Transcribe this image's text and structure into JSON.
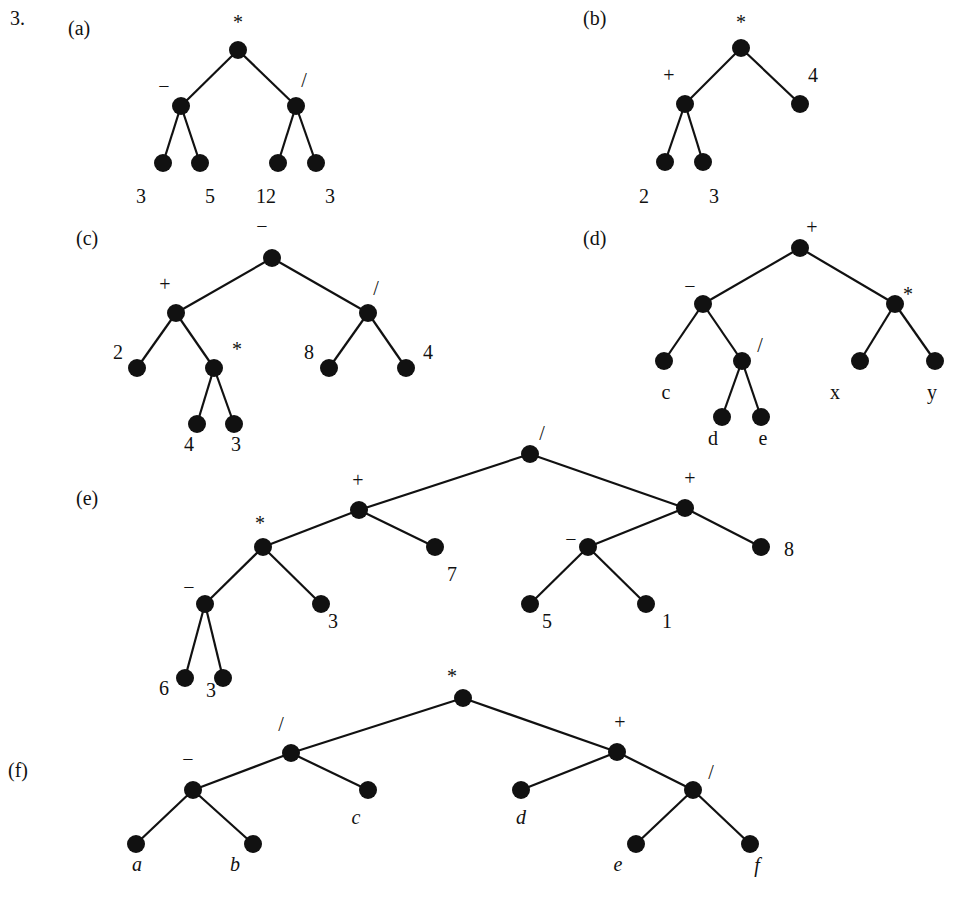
{
  "question_number": "3.",
  "node_radius": 9,
  "colors": {
    "ink": "#111111",
    "background": "#ffffff"
  },
  "trees": [
    {
      "part": "(a)",
      "part_pos": [
        68,
        18
      ],
      "expression": "(3 - 5) * (12 / 3)",
      "nodes": [
        {
          "id": "a0",
          "x": 238,
          "y": 50,
          "label": "*",
          "lx": 238,
          "ly": 22
        },
        {
          "id": "a1",
          "x": 181,
          "y": 106,
          "label": "−",
          "lx": 164,
          "ly": 86
        },
        {
          "id": "a2",
          "x": 296,
          "y": 106,
          "label": "/",
          "lx": 304,
          "ly": 80
        },
        {
          "id": "a3",
          "x": 163,
          "y": 163,
          "label": "3",
          "lx": 141,
          "ly": 196
        },
        {
          "id": "a4",
          "x": 200,
          "y": 163,
          "label": "5",
          "lx": 210,
          "ly": 196
        },
        {
          "id": "a5",
          "x": 278,
          "y": 163,
          "label": "12",
          "lx": 266,
          "ly": 196
        },
        {
          "id": "a6",
          "x": 316,
          "y": 163,
          "label": "3",
          "lx": 330,
          "ly": 196
        }
      ],
      "edges": [
        [
          "a0",
          "a1"
        ],
        [
          "a0",
          "a2"
        ],
        [
          "a1",
          "a3"
        ],
        [
          "a1",
          "a4"
        ],
        [
          "a2",
          "a5"
        ],
        [
          "a2",
          "a6"
        ]
      ]
    },
    {
      "part": "(b)",
      "part_pos": [
        583,
        8
      ],
      "expression": "(2 + 3) * 4",
      "nodes": [
        {
          "id": "b0",
          "x": 741,
          "y": 48,
          "label": "*",
          "lx": 741,
          "ly": 22
        },
        {
          "id": "b1",
          "x": 685,
          "y": 104,
          "label": "+",
          "lx": 669,
          "ly": 75
        },
        {
          "id": "b2",
          "x": 800,
          "y": 104,
          "label": "4",
          "lx": 813,
          "ly": 75
        },
        {
          "id": "b3",
          "x": 665,
          "y": 162,
          "label": "2",
          "lx": 644,
          "ly": 196
        },
        {
          "id": "b4",
          "x": 703,
          "y": 162,
          "label": "3",
          "lx": 714,
          "ly": 196
        }
      ],
      "edges": [
        [
          "b0",
          "b1"
        ],
        [
          "b0",
          "b2"
        ],
        [
          "b1",
          "b3"
        ],
        [
          "b1",
          "b4"
        ]
      ]
    },
    {
      "part": "(c)",
      "part_pos": [
        76,
        228
      ],
      "expression": "(2 + 4 * 3) - 8 / 4",
      "nodes": [
        {
          "id": "c0",
          "x": 272,
          "y": 258,
          "label": "−",
          "lx": 262,
          "ly": 226
        },
        {
          "id": "c1",
          "x": 176,
          "y": 313,
          "label": "+",
          "lx": 165,
          "ly": 284
        },
        {
          "id": "c2",
          "x": 368,
          "y": 313,
          "label": "/",
          "lx": 376,
          "ly": 288
        },
        {
          "id": "c3",
          "x": 137,
          "y": 368,
          "label": "2",
          "lx": 118,
          "ly": 352
        },
        {
          "id": "c4",
          "x": 214,
          "y": 368,
          "label": "*",
          "lx": 237,
          "ly": 349
        },
        {
          "id": "c5",
          "x": 329,
          "y": 368,
          "label": "8",
          "lx": 309,
          "ly": 352
        },
        {
          "id": "c6",
          "x": 406,
          "y": 368,
          "label": "4",
          "lx": 428,
          "ly": 352
        },
        {
          "id": "c7",
          "x": 197,
          "y": 424,
          "label": "4",
          "lx": 189,
          "ly": 444
        },
        {
          "id": "c8",
          "x": 234,
          "y": 424,
          "label": "3",
          "lx": 236,
          "ly": 444
        }
      ],
      "edges": [
        [
          "c0",
          "c1"
        ],
        [
          "c0",
          "c2"
        ],
        [
          "c1",
          "c3"
        ],
        [
          "c1",
          "c4"
        ],
        [
          "c2",
          "c5"
        ],
        [
          "c2",
          "c6"
        ],
        [
          "c4",
          "c7"
        ],
        [
          "c4",
          "c8"
        ]
      ]
    },
    {
      "part": "(d)",
      "part_pos": [
        583,
        228
      ],
      "expression": "(c - d / e) + x * y",
      "nodes": [
        {
          "id": "d0",
          "x": 800,
          "y": 248,
          "label": "+",
          "lx": 812,
          "ly": 227
        },
        {
          "id": "d1",
          "x": 703,
          "y": 304,
          "label": "−",
          "lx": 690,
          "ly": 286
        },
        {
          "id": "d2",
          "x": 895,
          "y": 304,
          "label": "*",
          "lx": 908,
          "ly": 294
        },
        {
          "id": "d3",
          "x": 664,
          "y": 361,
          "label": "c",
          "lx": 666,
          "ly": 392
        },
        {
          "id": "d4",
          "x": 742,
          "y": 361,
          "label": "/",
          "lx": 760,
          "ly": 345
        },
        {
          "id": "d5",
          "x": 860,
          "y": 361,
          "label": "x",
          "lx": 835,
          "ly": 392
        },
        {
          "id": "d6",
          "x": 935,
          "y": 361,
          "label": "y",
          "lx": 932,
          "ly": 392
        },
        {
          "id": "d7",
          "x": 722,
          "y": 417,
          "label": "d",
          "lx": 713,
          "ly": 438
        },
        {
          "id": "d8",
          "x": 761,
          "y": 417,
          "label": "e",
          "lx": 763,
          "ly": 438
        }
      ],
      "edges": [
        [
          "d0",
          "d1"
        ],
        [
          "d0",
          "d2"
        ],
        [
          "d1",
          "d3"
        ],
        [
          "d1",
          "d4"
        ],
        [
          "d2",
          "d5"
        ],
        [
          "d2",
          "d6"
        ],
        [
          "d4",
          "d7"
        ],
        [
          "d4",
          "d8"
        ]
      ]
    },
    {
      "part": "(e)",
      "part_pos": [
        76,
        488
      ],
      "expression": "((6 - 3) * 3 + 7) / ((5 - 1) + 8)",
      "nodes": [
        {
          "id": "e0",
          "x": 530,
          "y": 454,
          "label": "/",
          "lx": 542,
          "ly": 433
        },
        {
          "id": "e1",
          "x": 359,
          "y": 510,
          "label": "+",
          "lx": 358,
          "ly": 480
        },
        {
          "id": "e2",
          "x": 685,
          "y": 508,
          "label": "+",
          "lx": 690,
          "ly": 478
        },
        {
          "id": "e3",
          "x": 263,
          "y": 547,
          "label": "*",
          "lx": 260,
          "ly": 523
        },
        {
          "id": "e4",
          "x": 435,
          "y": 547,
          "label": "7",
          "lx": 452,
          "ly": 574
        },
        {
          "id": "e5",
          "x": 588,
          "y": 547,
          "label": "−",
          "lx": 571,
          "ly": 539
        },
        {
          "id": "e6",
          "x": 761,
          "y": 547,
          "label": "8",
          "lx": 789,
          "ly": 549
        },
        {
          "id": "e7",
          "x": 205,
          "y": 604,
          "label": "−",
          "lx": 189,
          "ly": 587
        },
        {
          "id": "e8",
          "x": 321,
          "y": 604,
          "label": "3",
          "lx": 333,
          "ly": 621
        },
        {
          "id": "e9",
          "x": 530,
          "y": 604,
          "label": "5",
          "lx": 547,
          "ly": 621
        },
        {
          "id": "e10",
          "x": 646,
          "y": 604,
          "label": "1",
          "lx": 667,
          "ly": 621
        },
        {
          "id": "e11",
          "x": 185,
          "y": 678,
          "label": "6",
          "lx": 164,
          "ly": 688
        },
        {
          "id": "e12",
          "x": 223,
          "y": 678,
          "label": "3",
          "lx": 211,
          "ly": 690
        }
      ],
      "edges": [
        [
          "e0",
          "e1"
        ],
        [
          "e0",
          "e2"
        ],
        [
          "e1",
          "e3"
        ],
        [
          "e1",
          "e4"
        ],
        [
          "e2",
          "e5"
        ],
        [
          "e2",
          "e6"
        ],
        [
          "e3",
          "e7"
        ],
        [
          "e3",
          "e8"
        ],
        [
          "e5",
          "e9"
        ],
        [
          "e5",
          "e10"
        ],
        [
          "e7",
          "e11"
        ],
        [
          "e7",
          "e12"
        ]
      ]
    },
    {
      "part": "(f)",
      "part_pos": [
        8,
        760
      ],
      "expression": "((a - b) / c) * (d + e / f)",
      "nodes": [
        {
          "id": "f0",
          "x": 463,
          "y": 698,
          "label": "*",
          "lx": 452,
          "ly": 676,
          "italic": false
        },
        {
          "id": "f1",
          "x": 291,
          "y": 753,
          "label": "/",
          "lx": 281,
          "ly": 724,
          "italic": false
        },
        {
          "id": "f2",
          "x": 617,
          "y": 752,
          "label": "+",
          "lx": 620,
          "ly": 722,
          "italic": false
        },
        {
          "id": "f3",
          "x": 193,
          "y": 790,
          "label": "−",
          "lx": 188,
          "ly": 759,
          "italic": false
        },
        {
          "id": "f4",
          "x": 368,
          "y": 790,
          "label": "c",
          "lx": 356,
          "ly": 817,
          "italic": true
        },
        {
          "id": "f5",
          "x": 521,
          "y": 790,
          "label": "d",
          "lx": 521,
          "ly": 817,
          "italic": true
        },
        {
          "id": "f6",
          "x": 693,
          "y": 790,
          "label": "/",
          "lx": 711,
          "ly": 772,
          "italic": false
        },
        {
          "id": "f7",
          "x": 136,
          "y": 844,
          "label": "a",
          "lx": 137,
          "ly": 864,
          "italic": true
        },
        {
          "id": "f8",
          "x": 253,
          "y": 844,
          "label": "b",
          "lx": 235,
          "ly": 864,
          "italic": true
        },
        {
          "id": "f9",
          "x": 636,
          "y": 844,
          "label": "e",
          "lx": 618,
          "ly": 864,
          "italic": true
        },
        {
          "id": "f10",
          "x": 750,
          "y": 844,
          "label": "f",
          "lx": 757,
          "ly": 865,
          "italic": true
        }
      ],
      "edges": [
        [
          "f0",
          "f1"
        ],
        [
          "f0",
          "f2"
        ],
        [
          "f1",
          "f3"
        ],
        [
          "f1",
          "f4"
        ],
        [
          "f2",
          "f5"
        ],
        [
          "f2",
          "f6"
        ],
        [
          "f3",
          "f7"
        ],
        [
          "f3",
          "f8"
        ],
        [
          "f6",
          "f9"
        ],
        [
          "f6",
          "f10"
        ]
      ]
    }
  ]
}
